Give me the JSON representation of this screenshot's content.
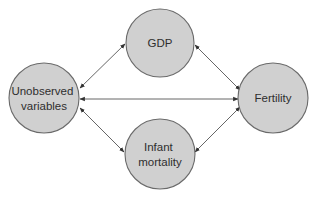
{
  "diagram": {
    "type": "causal-graph",
    "colors": {
      "node_fill": "#d0d0d0",
      "node_stroke": "#6a6a6a",
      "edge": "#555555",
      "text": "#2e2e2e",
      "background": "#ffffff"
    },
    "nodes": [
      {
        "id": "unobserved",
        "lines": [
          "Unobserved",
          "variables"
        ],
        "cx": 44,
        "cy": 98,
        "r": 35
      },
      {
        "id": "gdp",
        "lines": [
          "GDP"
        ],
        "cx": 160,
        "cy": 43,
        "r": 34
      },
      {
        "id": "fertility",
        "lines": [
          "Fertility"
        ],
        "cx": 273,
        "cy": 98,
        "r": 35
      },
      {
        "id": "infant_mortality",
        "lines": [
          "Infant",
          "mortality"
        ],
        "cx": 160,
        "cy": 154,
        "r": 35
      }
    ],
    "edges": [
      {
        "from": "unobserved",
        "to": "gdp",
        "direction": "bidirectional",
        "x1": 80,
        "y1": 88,
        "x2": 125,
        "y2": 44
      },
      {
        "from": "gdp",
        "to": "fertility",
        "direction": "bidirectional",
        "x1": 195,
        "y1": 45,
        "x2": 240,
        "y2": 90
      },
      {
        "from": "unobserved",
        "to": "fertility",
        "direction": "bidirectional",
        "x1": 80,
        "y1": 99,
        "x2": 238,
        "y2": 99
      },
      {
        "from": "unobserved",
        "to": "infant_mortality",
        "direction": "bidirectional",
        "x1": 80,
        "y1": 108,
        "x2": 124,
        "y2": 152
      },
      {
        "from": "infant_mortality",
        "to": "fertility",
        "direction": "bidirectional",
        "x1": 195,
        "y1": 152,
        "x2": 240,
        "y2": 107
      }
    ]
  }
}
